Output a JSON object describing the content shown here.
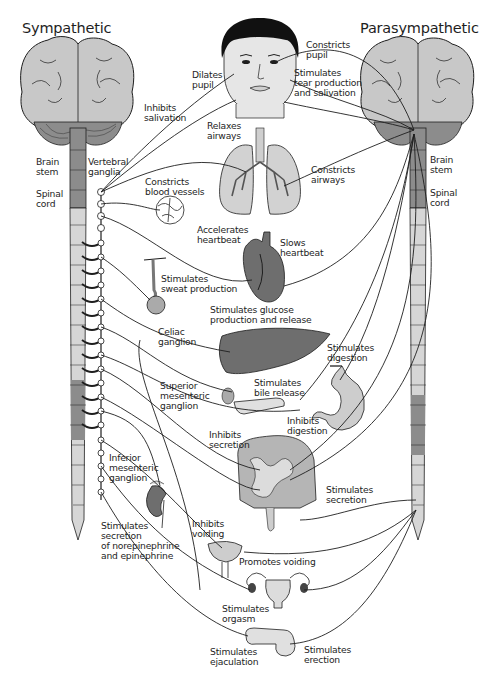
{
  "diagram": {
    "titles": {
      "sympathetic": "Sympathetic",
      "parasympathetic": "Parasympathetic"
    },
    "colors": {
      "brain_fill": "#c8c8c8",
      "organ_dark": "#6e6e6e",
      "organ_light": "#cdcdcd",
      "cord_dark": "#8c8c8c",
      "cord_light": "#d6d6d6",
      "line": "#1e1e1e",
      "hair": "#111111"
    },
    "anatomy_labels": {
      "left_brain_stem": "Brain\nstem",
      "left_spinal_cord": "Spinal\ncord",
      "vertebral_ganglia": "Vertebral\nganglia",
      "right_brain_stem": "Brain\nstem",
      "right_spinal_cord": "Spinal\ncord",
      "celiac_ganglion": "Celiac\nganglion",
      "superior_mesenteric_ganglion": "Superior\nmesenteric\nganglion",
      "inferior_mesenteric_ganglion": "Inferior\nmesenteric\nganglion"
    },
    "sympathetic_effects": {
      "dilates_pupil": "Dilates\npupil",
      "inhibits_salivation": "Inhibits\nsalivation",
      "relaxes_airways": "Relaxes\nairways",
      "constricts_blood_vessels": "Constricts\nblood vessels",
      "accelerates_heartbeat": "Accelerates\nheartbeat",
      "stimulates_sweat": "Stimulates\nsweat production",
      "stimulates_glucose": "Stimulates glucose\nproduction and release",
      "inhibits_digestion": "Inhibits\ndigestion",
      "inhibits_secretion": "Inhibits\nsecretion",
      "stimulates_adrenal": "Stimulates\nsecretion\nof norepinephrine\nand epinephrine",
      "inhibits_voiding": "Inhibits\nvoiding",
      "stimulates_orgasm": "Stimulates\norgasm",
      "stimulates_ejaculation": "Stimulates\nejaculation"
    },
    "parasympathetic_effects": {
      "constricts_pupil": "Constricts\npupil",
      "stimulates_tears": "Stimulates\ntear production\nand salivation",
      "constricts_airways": "Constricts\nairways",
      "slows_heartbeat": "Slows\nheartbeat",
      "stimulates_digestion": "Stimulates\ndigestion",
      "stimulates_bile": "Stimulates\nbile release",
      "stimulates_secretion": "Stimulates\nsecretion",
      "promotes_voiding": "Promotes voiding",
      "stimulates_erection": "Stimulates\nerection"
    }
  }
}
